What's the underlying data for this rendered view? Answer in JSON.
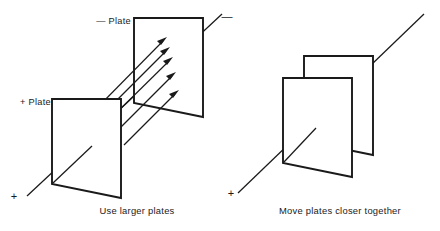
{
  "figure": {
    "background_color": "#ffffff",
    "ink_color": "#1a1a1a",
    "panels": [
      {
        "id": "use-larger-plates",
        "caption": "Use larger plates",
        "plate_labels": {
          "positive": "+ Plate",
          "negative": "— Plate"
        },
        "axis_signs": {
          "lower_left": "+",
          "upper_right": "—"
        },
        "field_arrow_count": 5
      },
      {
        "id": "move-plates-closer-together",
        "caption": "Move plates closer together",
        "plate_labels": {
          "positive": "",
          "negative": ""
        },
        "axis_signs": {
          "lower_left": "+",
          "upper_right": ""
        },
        "field_arrow_count": 0
      }
    ]
  }
}
